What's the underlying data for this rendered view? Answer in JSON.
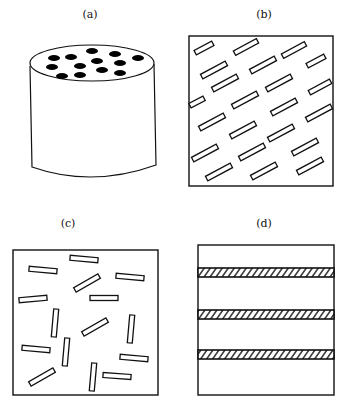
{
  "panels": {
    "a": {
      "label": "(a)",
      "description": "cylinder with aligned fibers (top view shows fiber ends)"
    },
    "b": {
      "label": "(b)",
      "description": "aligned short fibers, oriented diagonally"
    },
    "c": {
      "label": "(c)",
      "description": "randomly oriented short fibers"
    },
    "d": {
      "label": "(d)",
      "description": "layered laminate with hatched layers"
    }
  },
  "colors": {
    "stroke": "#111111",
    "fill": "#ffffff",
    "dot": "#000000"
  }
}
